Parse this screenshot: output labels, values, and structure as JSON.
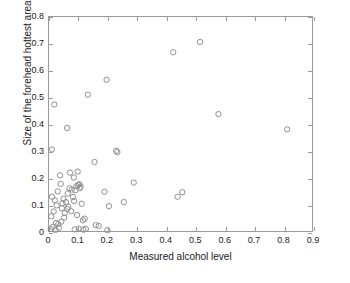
{
  "chart_data": {
    "type": "scatter",
    "title": "",
    "xlabel": "Measured alcohol level",
    "ylabel": "Size of the forehead hottest area[% of total image]",
    "xlim": [
      0,
      0.9
    ],
    "ylim": [
      0,
      0.8
    ],
    "xticks": [
      "0",
      "0.1",
      "0.2",
      "0.3",
      "0.4",
      "0.5",
      "0.6",
      "0.7",
      "0.8",
      "0.9"
    ],
    "xtick_values": [
      0,
      0.1,
      0.2,
      0.3,
      0.4,
      0.5,
      0.6,
      0.7,
      0.8,
      0.9
    ],
    "yticks": [
      "0",
      "0.1",
      "0.2",
      "0.3",
      "0.4",
      "0.5",
      "0.6",
      "0.7",
      "0.8"
    ],
    "ytick_values": [
      0,
      0.1,
      0.2,
      0.3,
      0.4,
      0.5,
      0.6,
      0.7,
      0.8
    ],
    "grid": false,
    "legend": null,
    "marker": "open-circle",
    "marker_color": "#8e8e8e",
    "marker_size": 4,
    "series": [
      {
        "name": "samples",
        "x": [
          0.018,
          0.062,
          0.133,
          0.197,
          0.425,
          0.517,
          0.01,
          0.038,
          0.156,
          0.234,
          0.23,
          0.58,
          0.815,
          0.01,
          0.04,
          0.072,
          0.085,
          0.098,
          0.104,
          0.108,
          0.008,
          0.016,
          0.02,
          0.026,
          0.03,
          0.046,
          0.05,
          0.058,
          0.064,
          0.07,
          0.078,
          0.082,
          0.09,
          0.094,
          0.1,
          0.106,
          0.112,
          0.122,
          0.19,
          0.205,
          0.256,
          0.29,
          0.44,
          0.456,
          0.024,
          0.034,
          0.044,
          0.054,
          0.066,
          0.076,
          0.086,
          0.096,
          0.116,
          0.126,
          0.16,
          0.006,
          0.012,
          0.022,
          0.032,
          0.042,
          0.052,
          0.062,
          0.088,
          0.102,
          0.118,
          0.17,
          0.2
        ],
        "y": [
          0.473,
          0.385,
          0.51,
          0.565,
          0.668,
          0.707,
          0.305,
          0.208,
          0.258,
          0.295,
          0.3,
          0.437,
          0.38,
          0.128,
          0.176,
          0.218,
          0.2,
          0.222,
          0.175,
          0.166,
          0.055,
          0.073,
          0.114,
          0.096,
          0.148,
          0.104,
          0.12,
          0.108,
          0.14,
          0.16,
          0.155,
          0.127,
          0.152,
          0.168,
          0.172,
          0.16,
          0.102,
          0.046,
          0.147,
          0.093,
          0.108,
          0.181,
          0.128,
          0.145,
          0.03,
          0.012,
          0.085,
          0.068,
          0.09,
          0.074,
          0.112,
          0.06,
          0.04,
          0.008,
          0.022,
          0.007,
          0.015,
          0.004,
          0.026,
          0.035,
          0.05,
          0.082,
          0.006,
          0.009,
          0.005,
          0.019,
          0.003
        ]
      }
    ]
  }
}
